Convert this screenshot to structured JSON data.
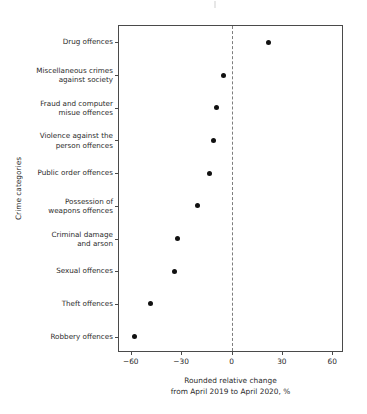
{
  "chart_data": {
    "type": "scatter",
    "title": "",
    "subtitle": "",
    "xlabel": "Rounded relative change\nfrom April 2019 to April 2020, %",
    "ylabel": "Crime categories",
    "xlim": [
      -67,
      67
    ],
    "xticks": [
      -60,
      -30,
      0,
      30,
      60
    ],
    "xtick_labels": [
      "−60",
      "−30",
      "0",
      "30",
      "60"
    ],
    "grid": false,
    "legend": null,
    "reference_line": {
      "x": 0,
      "style": "dashed"
    },
    "categories": [
      "Drug offences",
      "Miscellaneous crimes\nagainst society",
      "Fraud and computer\nmisue offences",
      "Violence against the\nperson offences",
      "Public order offences",
      "Possession of\nweapons offences",
      "Criminal damage\nand arson",
      "Sexual offences",
      "Theft offences",
      "Robbery offences"
    ],
    "values": [
      22,
      -5,
      -9,
      -11,
      -13,
      -20,
      -32,
      -34,
      -48,
      -58
    ],
    "points": [
      {
        "category": "Drug offences",
        "value": 22
      },
      {
        "category": "Miscellaneous crimes against society",
        "value": -5
      },
      {
        "category": "Fraud and computer misue offences",
        "value": -9
      },
      {
        "category": "Violence against the person offences",
        "value": -11
      },
      {
        "category": "Public order offences",
        "value": -13
      },
      {
        "category": "Possession of weapons offences",
        "value": -20
      },
      {
        "category": "Criminal damage and arson",
        "value": -32
      },
      {
        "category": "Sexual offences",
        "value": -34
      },
      {
        "category": "Theft offences",
        "value": -48
      },
      {
        "category": "Robbery offences",
        "value": -58
      }
    ],
    "marker_color": "#111111",
    "axis_color": "#4a4a4a",
    "reference_line_color": "#7d7d7d",
    "text_color": "#2b2b2b"
  }
}
